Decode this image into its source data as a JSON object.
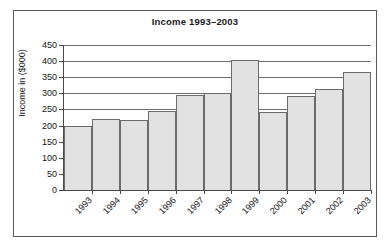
{
  "chart_data": {
    "type": "bar",
    "title": "Income 1993–2003",
    "xlabel": "",
    "ylabel": "Income in ($000)",
    "categories": [
      "1993",
      "1994",
      "1995",
      "1996",
      "1997",
      "1998",
      "1999",
      "2000",
      "2001",
      "2002",
      "2003"
    ],
    "values": [
      198,
      219,
      217,
      246,
      296,
      302,
      403,
      242,
      291,
      312,
      367
    ],
    "ylim": [
      0,
      450
    ],
    "ytick_labels": [
      "450",
      "400",
      "350",
      "300",
      "250",
      "200",
      "150",
      "100",
      "50",
      "0"
    ],
    "ytick_values": [
      450,
      400,
      350,
      300,
      250,
      200,
      150,
      100,
      50,
      0
    ],
    "ytick_step": 50,
    "grid": "horizontal",
    "legend": "none",
    "bar_fill_color": "#e2e2e2",
    "bar_edge_color": "#6b6b6b",
    "gridline_color": "#6e6e6e",
    "axis_color": "#4a4a4a",
    "background_color": "#ffffff",
    "frame_border_color": "#5a5a5a",
    "xtick_rotation_degrees": 45
  }
}
